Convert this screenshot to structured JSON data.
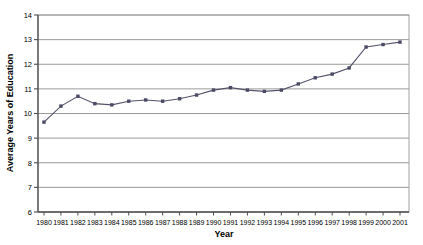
{
  "chart_data": {
    "type": "line",
    "title": "",
    "xlabel": "Year",
    "ylabel": "Average Years of Education",
    "categories": [
      1980,
      1981,
      1982,
      1983,
      1984,
      1985,
      1986,
      1987,
      1988,
      1989,
      1990,
      1991,
      1992,
      1993,
      1994,
      1995,
      1996,
      1997,
      1998,
      1999,
      2000,
      2001
    ],
    "values": [
      9.65,
      10.3,
      10.7,
      10.4,
      10.35,
      10.5,
      10.55,
      10.5,
      10.6,
      10.75,
      10.95,
      11.05,
      10.95,
      10.9,
      10.95,
      11.2,
      11.45,
      11.6,
      11.85,
      12.7,
      12.8,
      12.9
    ],
    "series": [
      {
        "name": "Average Years of Education",
        "values": [
          9.65,
          10.3,
          10.7,
          10.4,
          10.35,
          10.5,
          10.55,
          10.5,
          10.6,
          10.75,
          10.95,
          11.05,
          10.95,
          10.9,
          10.95,
          11.2,
          11.45,
          11.6,
          11.85,
          12.7,
          12.8,
          12.9
        ]
      }
    ],
    "xtick_labels": [
      "1980",
      "1981",
      "1982",
      "1983",
      "1984",
      "1985",
      "1986",
      "1987",
      "1988",
      "1989",
      "1990",
      "1991",
      "1992",
      "1993",
      "1994",
      "1995",
      "1996",
      "1997",
      "1998",
      "1999",
      "2000",
      "2001"
    ],
    "ytick_labels": [
      "6",
      "7",
      "8",
      "9",
      "10",
      "11",
      "12",
      "13",
      "14"
    ],
    "ytick_values": [
      6,
      7,
      8,
      9,
      10,
      11,
      12,
      13,
      14
    ],
    "ylim": [
      6,
      14
    ],
    "xlim": [
      1980,
      2001
    ],
    "grid": {
      "horizontal": true,
      "vertical": false,
      "color": "#808080"
    },
    "legend": {
      "visible": false,
      "position": "none"
    },
    "marker": {
      "shape": "square",
      "size": 3.4,
      "color": "#4a4a66"
    },
    "line": {
      "color": "#53536b",
      "width": 1.1
    },
    "plot_area_border_color": "#9a9a9a",
    "axis_color": "#4d4d4d"
  }
}
